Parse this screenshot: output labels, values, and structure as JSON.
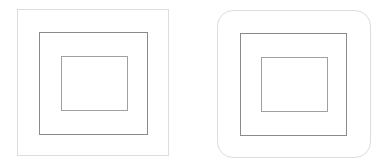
{
  "figures": [
    {
      "name": "square-corner-nested-boxes",
      "outer": {
        "x": 17,
        "y": 9,
        "w": 152,
        "h": 147,
        "radius": 0,
        "border": "#dddddd"
      },
      "middle": {
        "x": 39,
        "y": 32,
        "w": 109,
        "h": 103,
        "radius": 0,
        "border": "#8a8a8a"
      },
      "inner": {
        "x": 61,
        "y": 56,
        "w": 67,
        "h": 55,
        "radius": 0,
        "border": "#a0a0a0"
      }
    },
    {
      "name": "rounded-corner-nested-boxes",
      "outer": {
        "x": 217,
        "y": 10,
        "w": 154,
        "h": 148,
        "radius": 16,
        "border": "#dddddd"
      },
      "middle": {
        "x": 240,
        "y": 33,
        "w": 107,
        "h": 103,
        "radius": 0,
        "border": "#8a8a8a"
      },
      "inner": {
        "x": 261,
        "y": 57,
        "w": 67,
        "h": 55,
        "radius": 0,
        "border": "#a0a0a0"
      }
    }
  ]
}
